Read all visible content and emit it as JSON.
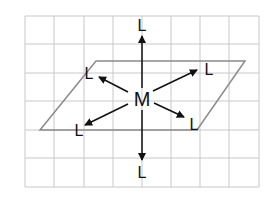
{
  "diagram": {
    "center_label": "M",
    "ligand_labels": [
      "L",
      "L",
      "L",
      "L",
      "L",
      "L"
    ],
    "colors": {
      "grid": "#c8c8c8",
      "plane": "#8a8a8a",
      "arrow": "#111111"
    }
  }
}
